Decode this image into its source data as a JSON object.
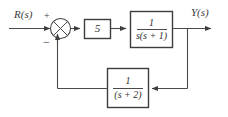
{
  "diagram": {
    "type": "control-system-block-diagram",
    "stroke_color": "#4a4a4a",
    "text_color": "#3a3a3a",
    "background": "#ffffff",
    "signals": {
      "input_label": "R(s)",
      "output_label": "Y(s)"
    },
    "summing_junction": {
      "name": "summing-junction",
      "input_sign_top": "+",
      "input_sign_bottom": "−"
    },
    "blocks": [
      {
        "id": "gain",
        "label": "5",
        "numerator": "5",
        "denominator": ""
      },
      {
        "id": "plant",
        "label": "1/(s(s+1))",
        "numerator": "1",
        "denominator": "s(s + 1)"
      },
      {
        "id": "feedback",
        "label": "1/(s+2)",
        "numerator": "1",
        "denominator": "(s + 2)"
      }
    ]
  }
}
